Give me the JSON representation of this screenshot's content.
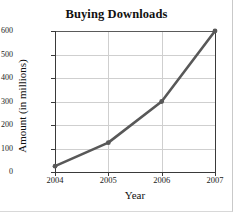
{
  "chart_data": {
    "type": "line",
    "title": "Buying Downloads",
    "xlabel": "Year",
    "ylabel": "Amount (in millions)",
    "categories": [
      "2004",
      "2005",
      "2006",
      "2007"
    ],
    "x": [
      2004,
      2005,
      2006,
      2007
    ],
    "values": [
      25,
      125,
      300,
      600
    ],
    "series": [
      {
        "name": "Buying Downloads",
        "values": [
          25,
          125,
          300,
          600
        ]
      }
    ],
    "xlim": [
      2004,
      2007
    ],
    "ylim": [
      0,
      600
    ],
    "ytick_labels": [
      "0",
      "100",
      "200",
      "300",
      "400",
      "500",
      "600"
    ],
    "ytick_values": [
      0,
      100,
      200,
      300,
      400,
      500,
      600
    ],
    "xtick_labels": [
      "2004",
      "2005",
      "2006",
      "2007"
    ],
    "grid": true,
    "legend": "none",
    "line_color": "#585858",
    "marker_color": "#585858",
    "grid_color": "#cfcfcf",
    "axis_color": "#3a3a3a"
  }
}
